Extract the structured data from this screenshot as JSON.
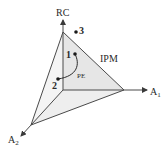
{
  "diagram": {
    "axes": {
      "vertical": "RC",
      "right": "A",
      "right_sub": "1",
      "left": "A",
      "left_sub": "2"
    },
    "region_label": "IPM",
    "path_label": "PE",
    "points": [
      {
        "id": "1",
        "label": "1"
      },
      {
        "id": "2",
        "label": "2"
      },
      {
        "id": "3",
        "label": "3"
      }
    ],
    "colors": {
      "line": "#4a4a4a",
      "fill": "#e9e9e9",
      "fill_light": "#f3f3f3",
      "text": "#2a2a2a"
    }
  }
}
